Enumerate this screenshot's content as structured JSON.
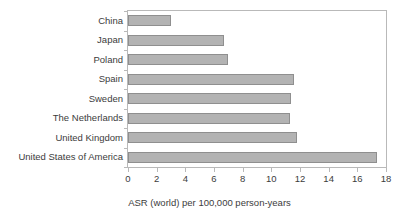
{
  "chart_data": {
    "type": "bar",
    "orientation": "horizontal",
    "title": "",
    "subtitle": "",
    "xlabel": "ASR (world) per 100,000 person-years",
    "ylabel": "",
    "categories": [
      "China",
      "Japan",
      "Poland",
      "Spain",
      "Sweden",
      "The Netherlands",
      "United Kingdom",
      "United States of America"
    ],
    "values": [
      3.0,
      6.7,
      7.0,
      11.6,
      11.4,
      11.3,
      11.8,
      17.4
    ],
    "xlim": [
      0,
      18
    ],
    "xticks": [
      0,
      2,
      4,
      6,
      8,
      10,
      12,
      14,
      16,
      18
    ],
    "xticklabels": [
      "0",
      "2",
      "4",
      "6",
      "8",
      "10",
      "12",
      "14",
      "16",
      "18"
    ],
    "grid": false,
    "legend": null,
    "legend_position": "none",
    "bar_color": "#b3b3b3",
    "bar_edge_color": "#8f8f8f",
    "frame_color": "#b9b9b9",
    "text_color": "#3c3c3c",
    "background_color": "#ffffff"
  }
}
